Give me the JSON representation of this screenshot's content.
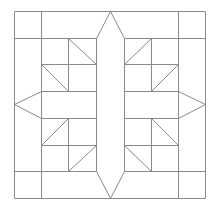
{
  "diagram": {
    "stroke_color": "#8a8a8a",
    "background": "#ffffff",
    "grid": {
      "x": [
        14,
        41,
        68,
        96,
        124,
        151,
        178,
        205
      ],
      "y": [
        11,
        38,
        64,
        91,
        118,
        145,
        171,
        198
      ]
    },
    "segments": [
      {
        "name": "outer-top",
        "pts": [
          [
            14,
            11
          ],
          [
            205,
            11
          ]
        ]
      },
      {
        "name": "outer-bottom",
        "pts": [
          [
            14,
            198
          ],
          [
            205,
            198
          ]
        ]
      },
      {
        "name": "outer-left",
        "pts": [
          [
            14,
            11
          ],
          [
            14,
            198
          ]
        ]
      },
      {
        "name": "outer-right",
        "pts": [
          [
            205,
            11
          ],
          [
            205,
            198
          ]
        ]
      },
      {
        "name": "v-41",
        "pts": [
          [
            41,
            11
          ],
          [
            41,
            198
          ]
        ]
      },
      {
        "name": "v-178",
        "pts": [
          [
            178,
            11
          ],
          [
            178,
            198
          ]
        ]
      },
      {
        "name": "h-38-left",
        "pts": [
          [
            14,
            38
          ],
          [
            96,
            38
          ]
        ]
      },
      {
        "name": "h-38-right",
        "pts": [
          [
            124,
            38
          ],
          [
            205,
            38
          ]
        ]
      },
      {
        "name": "h-171-left",
        "pts": [
          [
            14,
            171
          ],
          [
            96,
            171
          ]
        ]
      },
      {
        "name": "h-171-right",
        "pts": [
          [
            124,
            171
          ],
          [
            205,
            171
          ]
        ]
      },
      {
        "name": "v-96",
        "pts": [
          [
            96,
            38
          ],
          [
            96,
            171
          ]
        ]
      },
      {
        "name": "v-124",
        "pts": [
          [
            124,
            38
          ],
          [
            124,
            171
          ]
        ]
      },
      {
        "name": "h-91-left",
        "pts": [
          [
            41,
            91
          ],
          [
            96,
            91
          ]
        ]
      },
      {
        "name": "h-91-right",
        "pts": [
          [
            124,
            91
          ],
          [
            178,
            91
          ]
        ]
      },
      {
        "name": "h-118-left",
        "pts": [
          [
            41,
            118
          ],
          [
            96,
            118
          ]
        ]
      },
      {
        "name": "h-118-right",
        "pts": [
          [
            124,
            118
          ],
          [
            178,
            118
          ]
        ]
      },
      {
        "name": "v-68-top",
        "pts": [
          [
            68,
            38
          ],
          [
            68,
            91
          ]
        ]
      },
      {
        "name": "v-68-bottom",
        "pts": [
          [
            68,
            118
          ],
          [
            68,
            171
          ]
        ]
      },
      {
        "name": "v-151-top",
        "pts": [
          [
            151,
            38
          ],
          [
            151,
            91
          ]
        ]
      },
      {
        "name": "v-151-bottom",
        "pts": [
          [
            151,
            118
          ],
          [
            151,
            171
          ]
        ]
      },
      {
        "name": "h-64-left",
        "pts": [
          [
            41,
            64
          ],
          [
            96,
            64
          ]
        ]
      },
      {
        "name": "h-64-right",
        "pts": [
          [
            124,
            64
          ],
          [
            178,
            64
          ]
        ]
      },
      {
        "name": "h-145-left",
        "pts": [
          [
            41,
            145
          ],
          [
            96,
            145
          ]
        ]
      },
      {
        "name": "h-145-right",
        "pts": [
          [
            124,
            145
          ],
          [
            178,
            145
          ]
        ]
      },
      {
        "name": "star-point-top",
        "pts": [
          [
            96,
            38
          ],
          [
            110,
            11
          ],
          [
            124,
            38
          ]
        ]
      },
      {
        "name": "star-point-bottom",
        "pts": [
          [
            96,
            171
          ],
          [
            110,
            198
          ],
          [
            124,
            171
          ]
        ]
      },
      {
        "name": "star-point-left",
        "pts": [
          [
            41,
            91
          ],
          [
            14,
            104
          ],
          [
            41,
            118
          ]
        ]
      },
      {
        "name": "star-point-right",
        "pts": [
          [
            178,
            91
          ],
          [
            205,
            104
          ],
          [
            178,
            118
          ]
        ]
      },
      {
        "name": "diag-ul-1",
        "pts": [
          [
            68,
            38
          ],
          [
            96,
            64
          ]
        ]
      },
      {
        "name": "diag-ul-2",
        "pts": [
          [
            41,
            64
          ],
          [
            68,
            91
          ]
        ]
      },
      {
        "name": "diag-ur-1",
        "pts": [
          [
            151,
            38
          ],
          [
            124,
            64
          ]
        ]
      },
      {
        "name": "diag-ur-2",
        "pts": [
          [
            178,
            64
          ],
          [
            151,
            91
          ]
        ]
      },
      {
        "name": "diag-ll-1",
        "pts": [
          [
            68,
            118
          ],
          [
            41,
            145
          ]
        ]
      },
      {
        "name": "diag-ll-2",
        "pts": [
          [
            96,
            145
          ],
          [
            68,
            171
          ]
        ]
      },
      {
        "name": "diag-lr-1",
        "pts": [
          [
            151,
            118
          ],
          [
            178,
            145
          ]
        ]
      },
      {
        "name": "diag-lr-2",
        "pts": [
          [
            124,
            145
          ],
          [
            151,
            171
          ]
        ]
      }
    ]
  }
}
